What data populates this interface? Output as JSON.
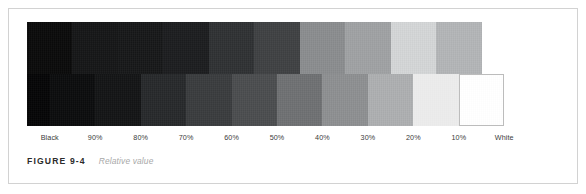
{
  "figure": {
    "caption_label": "FIGURE 9-4",
    "caption_title": "Relative value",
    "frame_color": "#d2d2d2"
  },
  "chart_data": {
    "type": "bar",
    "title": "Relative value",
    "subtitle": "",
    "xlabel": "",
    "ylabel": "",
    "grid": false,
    "legend": "none",
    "note": "Grayscale step scale: an upper band of 10 tonal steps (Black through 10%) and a lower band of 11 tonal steps (Black through White) offset by half a step, producing a staircase of relative values.",
    "categories": [
      "Black",
      "90%",
      "80%",
      "70%",
      "60%",
      "50%",
      "40%",
      "30%",
      "20%",
      "10%",
      "White"
    ],
    "tick_labels": [
      "Black",
      "90%",
      "80%",
      "70%",
      "60%",
      "50%",
      "40%",
      "30%",
      "20%",
      "10%",
      "White"
    ],
    "values": [
      100,
      90,
      80,
      70,
      60,
      50,
      40,
      30,
      20,
      10,
      0
    ],
    "ylim": [
      0,
      100
    ],
    "series": [
      {
        "name": "Upper band",
        "swatch_count": 10,
        "steps": [
          {
            "label": "Black",
            "ink_percent": 100,
            "hex": "#0a0a0a"
          },
          {
            "label": "90%",
            "ink_percent": 90,
            "hex": "#151617"
          },
          {
            "label": "80%",
            "ink_percent": 80,
            "hex": "#171819"
          },
          {
            "label": "70%",
            "ink_percent": 70,
            "hex": "#1c1d1f"
          },
          {
            "label": "60%",
            "ink_percent": 60,
            "hex": "#2f3133"
          },
          {
            "label": "50%",
            "ink_percent": 50,
            "hex": "#3f4143"
          },
          {
            "label": "40%",
            "ink_percent": 40,
            "hex": "#8b8d8f"
          },
          {
            "label": "30%",
            "ink_percent": 30,
            "hex": "#a0a2a4"
          },
          {
            "label": "20%",
            "ink_percent": 20,
            "hex": "#d5d7d8"
          },
          {
            "label": "10%",
            "ink_percent": 10,
            "hex": "#b4b6b8"
          }
        ]
      },
      {
        "name": "Lower band",
        "swatch_count": 11,
        "steps": [
          {
            "label": "Black",
            "ink_percent": 100,
            "hex": "#050506"
          },
          {
            "label": "90%",
            "ink_percent": 90,
            "hex": "#0b0c0d"
          },
          {
            "label": "80%",
            "ink_percent": 80,
            "hex": "#131415"
          },
          {
            "label": "70%",
            "ink_percent": 70,
            "hex": "#27292b"
          },
          {
            "label": "60%",
            "ink_percent": 60,
            "hex": "#3a3c3e"
          },
          {
            "label": "50%",
            "ink_percent": 50,
            "hex": "#4b4d4f"
          },
          {
            "label": "40%",
            "ink_percent": 40,
            "hex": "#6f7173"
          },
          {
            "label": "30%",
            "ink_percent": 30,
            "hex": "#8e9092"
          },
          {
            "label": "20%",
            "ink_percent": 20,
            "hex": "#aeb0b2"
          },
          {
            "label": "10%",
            "ink_percent": 10,
            "hex": "#ececec"
          },
          {
            "label": "White",
            "ink_percent": 0,
            "hex": "#ffffff"
          }
        ]
      }
    ]
  }
}
